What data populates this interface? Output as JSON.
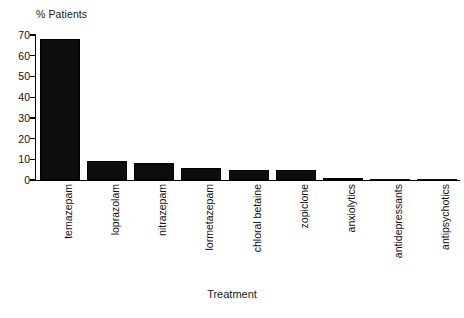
{
  "chart_data": {
    "type": "bar",
    "title": "",
    "ylabel": "% Patients",
    "xlabel": "Treatment",
    "ylim": [
      0,
      70
    ],
    "yticks": [
      0,
      10,
      20,
      30,
      40,
      50,
      60,
      70
    ],
    "grid": false,
    "legend": null,
    "categories": [
      "temazepam",
      "loprazolam",
      "nitrazepam",
      "lormetazepam",
      "chloral betaine",
      "zopiclone",
      "anxiolytics",
      "antidepressants",
      "antipsychotics"
    ],
    "values": [
      68,
      9,
      8,
      6,
      5,
      5,
      1,
      0.3,
      0.2
    ],
    "bar_color": "#0d0d0d",
    "axis_color": "#000000",
    "background": "#ffffff"
  },
  "axis": {
    "y_title": "% Patients",
    "x_title": "Treatment"
  }
}
